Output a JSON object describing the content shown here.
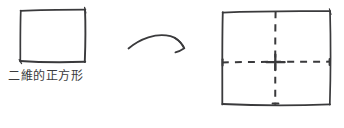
{
  "diagram": {
    "type": "hand-drawn-sketch",
    "background_color": "#ffffff",
    "ink_color": "#3a3a3c",
    "title": "",
    "left_figure": {
      "name": "two-dimensional square",
      "shape": "square",
      "stroke_style": "solid",
      "caption": "二維的正方形"
    },
    "arrow": {
      "name": "transformation arrow",
      "style": "curved",
      "direction": "left-to-right",
      "label": ""
    },
    "right_figure": {
      "name": "square with dashed center cross",
      "shape": "square",
      "stroke_style": "solid",
      "inner_lines": {
        "vertical": "dashed",
        "horizontal": "dashed"
      },
      "caption": ""
    }
  }
}
